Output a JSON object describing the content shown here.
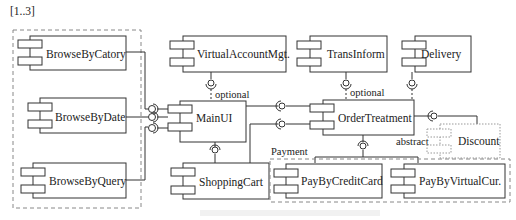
{
  "diagram": {
    "type": "UML component diagram",
    "multiplicity_label": "[1..3]",
    "groups": {
      "browse": {
        "label": "[1..3]"
      },
      "payment": {
        "label": "Payment"
      }
    },
    "components": {
      "browse_by_catory": "BrowseByCatory",
      "browse_by_date": "BrowseByDate",
      "browse_by_query": "BrowseByQuery",
      "virtual_account_mgt": "VirtualAccountMgt.",
      "main_ui": "MainUI",
      "shopping_cart": "ShoppingCart",
      "trans_inform": "TransInform",
      "delivery": "Delivery",
      "order_treatment": "OrderTreatment",
      "discount": "Discount",
      "pay_by_credit_card": "PayByCreditCard",
      "pay_by_virtual_cur": "PayByVirtualCur."
    },
    "annotations": {
      "optional_vam": "optional",
      "optional_trans": "optional",
      "abstract": "abstract",
      "payment": "Payment"
    },
    "colors": {
      "line": "#333333",
      "dashed": "#888888",
      "dotted": "#999999"
    }
  }
}
